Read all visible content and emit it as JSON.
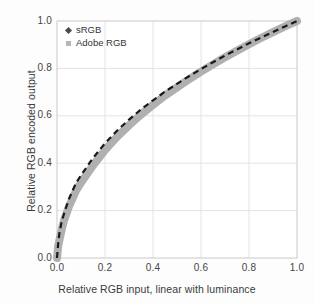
{
  "chart_data": {
    "type": "line",
    "title": "",
    "xlabel": "Relative RGB input, linear with luminance",
    "ylabel": "Relative RGB  encoded output",
    "xlim": [
      0.0,
      1.0
    ],
    "ylim": [
      0.0,
      1.0
    ],
    "grid": true,
    "legend_position": "top-left inside plot",
    "xticks": [
      "0.0",
      "0.2",
      "0.4",
      "0.6",
      "0.8",
      "1.0"
    ],
    "yticks": [
      "0.0",
      "0.2",
      "0.4",
      "0.6",
      "0.8",
      "1.0"
    ],
    "xtick_values": [
      0.0,
      0.2,
      0.4,
      0.6,
      0.8,
      1.0
    ],
    "ytick_values": [
      0.0,
      0.2,
      0.4,
      0.6,
      0.8,
      1.0
    ],
    "x": [
      0.0,
      0.005,
      0.01,
      0.02,
      0.03,
      0.05,
      0.08,
      0.1,
      0.15,
      0.2,
      0.25,
      0.3,
      0.35,
      0.4,
      0.45,
      0.5,
      0.55,
      0.6,
      0.65,
      0.7,
      0.75,
      0.8,
      0.85,
      0.9,
      0.95,
      1.0
    ],
    "series": [
      {
        "name": "sRGB",
        "marker": "diamond",
        "color": "#1a1a1a",
        "style": "dashed",
        "width": 2.2,
        "values": [
          0.0,
          0.062,
          0.105,
          0.156,
          0.189,
          0.25,
          0.318,
          0.349,
          0.422,
          0.484,
          0.537,
          0.584,
          0.627,
          0.665,
          0.702,
          0.735,
          0.767,
          0.797,
          0.826,
          0.854,
          0.88,
          0.906,
          0.93,
          0.954,
          0.977,
          1.0
        ]
      },
      {
        "name": "Adobe RGB",
        "marker": "square",
        "color": "#b0b0b0",
        "style": "solid-band",
        "width": 8.0,
        "values": [
          0.0,
          0.05,
          0.075,
          0.122,
          0.161,
          0.218,
          0.285,
          0.318,
          0.39,
          0.455,
          0.511,
          0.56,
          0.605,
          0.646,
          0.685,
          0.72,
          0.754,
          0.786,
          0.817,
          0.847,
          0.875,
          0.902,
          0.928,
          0.953,
          0.977,
          1.0
        ]
      }
    ],
    "legend": [
      "sRGB",
      "Adobe RGB"
    ],
    "colors": {
      "background": "#fdfdfd",
      "plot_background": "#ffffff",
      "gridline": "#e2e2e2",
      "axis_border": "#c9c9c9",
      "srgb_line": "#1a1a1a",
      "adobe_band": "#b0b0b0",
      "text": "#3a3a3a"
    }
  }
}
